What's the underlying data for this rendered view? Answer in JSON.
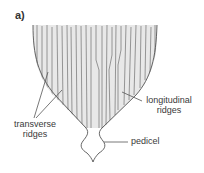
{
  "figure": {
    "panel_label": "a)",
    "labels": {
      "transverse": {
        "line1": "transverse",
        "line2": "ridges"
      },
      "longitudinal": {
        "line1": "longitudinal",
        "line2": "ridges"
      },
      "pedicel": "pedicel"
    },
    "colors": {
      "outline": "#555555",
      "ridge": "#9a9a9a",
      "text": "#3a3a3a"
    }
  }
}
